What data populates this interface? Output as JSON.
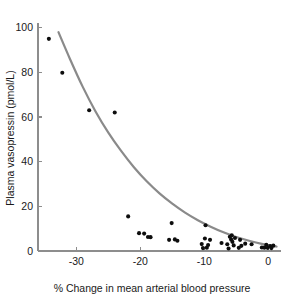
{
  "chart_data": {
    "type": "scatter",
    "title": "",
    "xlabel": "% Change in mean arterial blood pressure",
    "ylabel": "Plasma vasopressin (pmol/L)",
    "xlim": [
      -36,
      2
    ],
    "ylim": [
      0,
      103
    ],
    "grid": false,
    "legend": null,
    "xticks": [
      -30,
      -20,
      -10,
      0
    ],
    "xticklabels": [
      "-30",
      "-20",
      "-10",
      "0"
    ],
    "yticks": [
      0,
      20,
      40,
      60,
      80,
      100
    ],
    "yticklabels": [
      "0",
      "20",
      "40",
      "60",
      "80",
      "100"
    ],
    "marker": "filled-circle",
    "marker_color": "#0d0d0d",
    "curve_color": "#8a8a8a",
    "axis_color": "#8d8d8d",
    "text_color": "#1a1a1a",
    "background_color": "#ffffff",
    "points": [
      {
        "x": -34.3,
        "y": 95.0
      },
      {
        "x": -32.2,
        "y": 79.8
      },
      {
        "x": -28.0,
        "y": 63.0
      },
      {
        "x": -24.0,
        "y": 62.0
      },
      {
        "x": -21.9,
        "y": 15.5
      },
      {
        "x": -20.2,
        "y": 8.0
      },
      {
        "x": -19.4,
        "y": 7.8
      },
      {
        "x": -18.8,
        "y": 6.3
      },
      {
        "x": -18.4,
        "y": 6.2
      },
      {
        "x": -15.5,
        "y": 5.0
      },
      {
        "x": -15.1,
        "y": 12.5
      },
      {
        "x": -14.6,
        "y": 5.2
      },
      {
        "x": -14.2,
        "y": 4.6
      },
      {
        "x": -10.4,
        "y": 3.1
      },
      {
        "x": -10.2,
        "y": 1.3
      },
      {
        "x": -9.9,
        "y": 5.6
      },
      {
        "x": -9.8,
        "y": 11.5
      },
      {
        "x": -9.6,
        "y": 1.5
      },
      {
        "x": -9.4,
        "y": 2.7
      },
      {
        "x": -9.1,
        "y": 5.0
      },
      {
        "x": -7.3,
        "y": 3.6
      },
      {
        "x": -6.4,
        "y": 3.0
      },
      {
        "x": -6.2,
        "y": 1.1
      },
      {
        "x": -6.0,
        "y": 6.4
      },
      {
        "x": -5.8,
        "y": 5.2
      },
      {
        "x": -5.7,
        "y": 7.0
      },
      {
        "x": -5.6,
        "y": 4.1
      },
      {
        "x": -5.4,
        "y": 2.5
      },
      {
        "x": -5.2,
        "y": 5.8
      },
      {
        "x": -4.6,
        "y": 1.4
      },
      {
        "x": -4.4,
        "y": 5.0
      },
      {
        "x": -4.2,
        "y": 2.3
      },
      {
        "x": -3.6,
        "y": 3.3
      },
      {
        "x": -2.6,
        "y": 3.0
      },
      {
        "x": -1.0,
        "y": 1.6
      },
      {
        "x": -0.6,
        "y": 1.5
      },
      {
        "x": -0.3,
        "y": 2.8
      },
      {
        "x": -0.1,
        "y": 1.4
      },
      {
        "x": 0.3,
        "y": 2.2
      },
      {
        "x": 0.5,
        "y": 1.3
      },
      {
        "x": 0.8,
        "y": 2.4
      }
    ],
    "fit_curve": {
      "description": "exponential decay fit",
      "x_start": -32.8,
      "x_end": 1.3,
      "points": [
        {
          "x": -32.8,
          "y": 98.0
        },
        {
          "x": -31.0,
          "y": 86.0
        },
        {
          "x": -29.0,
          "y": 73.5
        },
        {
          "x": -27.0,
          "y": 62.5
        },
        {
          "x": -25.0,
          "y": 53.0
        },
        {
          "x": -23.0,
          "y": 44.8
        },
        {
          "x": -21.0,
          "y": 37.5
        },
        {
          "x": -19.0,
          "y": 31.2
        },
        {
          "x": -17.0,
          "y": 25.8
        },
        {
          "x": -15.0,
          "y": 21.2
        },
        {
          "x": -13.0,
          "y": 17.2
        },
        {
          "x": -11.0,
          "y": 13.8
        },
        {
          "x": -9.0,
          "y": 10.9
        },
        {
          "x": -7.0,
          "y": 8.4
        },
        {
          "x": -5.0,
          "y": 6.3
        },
        {
          "x": -3.0,
          "y": 4.6
        },
        {
          "x": -1.0,
          "y": 3.2
        },
        {
          "x": 1.3,
          "y": 2.0
        }
      ]
    }
  }
}
